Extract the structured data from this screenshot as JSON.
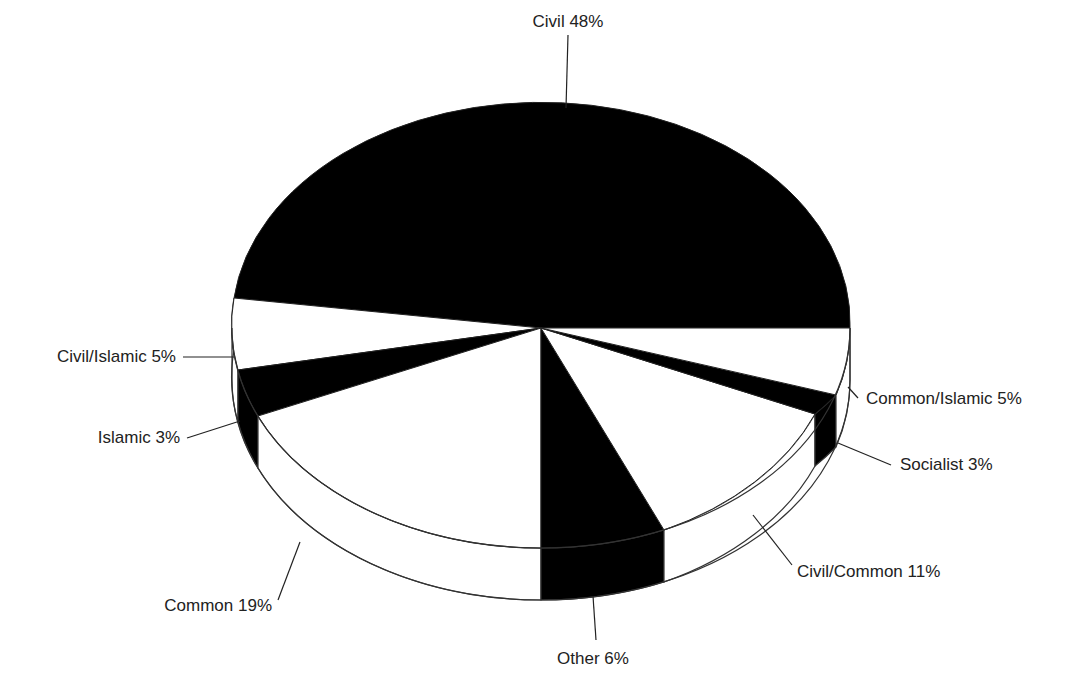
{
  "chart_data": {
    "type": "pie",
    "style": "3d-pie",
    "title": "",
    "categories": [
      "Civil",
      "Common/Islamic",
      "Socialist",
      "Civil/Common",
      "Other",
      "Common",
      "Islamic",
      "Civil/Islamic"
    ],
    "values": [
      48,
      5,
      3,
      11,
      6,
      19,
      3,
      5
    ],
    "unit": "%",
    "labels": [
      "Civil 48%",
      "Common/Islamic 5%",
      "Socialist 3%",
      "Civil/Common 11%",
      "Other 6%",
      "Common 19%",
      "Islamic 3%",
      "Civil/Islamic 5%"
    ],
    "colors": [
      "#000000",
      "#ffffff",
      "#000000",
      "#ffffff",
      "#000000",
      "#ffffff",
      "#000000",
      "#ffffff"
    ],
    "legend": "none (callout labels with leader lines)"
  },
  "geometry": {
    "cx": 541,
    "cy": 328,
    "rx": 309,
    "ry": 220,
    "depth": 52,
    "rim": {
      "right": [
        850,
        328
      ],
      "civil_left": [
        234,
        298
      ],
      "civislamic_end": [
        238,
        370
      ],
      "islamic_end": [
        258,
        416
      ],
      "common_end": [
        541,
        548
      ],
      "other_end": [
        664,
        530
      ],
      "civcommon_end": [
        815,
        414
      ],
      "socialist_end": [
        836,
        395
      ]
    }
  },
  "callouts": [
    {
      "key": "civil",
      "text": "Civil 48%",
      "x": 568,
      "y": 27,
      "anchor": "middle",
      "line": [
        [
          568,
          35
        ],
        [
          566,
          108
        ]
      ]
    },
    {
      "key": "civ_islamic",
      "text": "Civil/Islamic 5%",
      "x": 176,
      "y": 362,
      "anchor": "end",
      "line": [
        [
          183,
          357
        ],
        [
          234,
          357
        ]
      ]
    },
    {
      "key": "islamic",
      "text": "Islamic 3%",
      "x": 180,
      "y": 443,
      "anchor": "end",
      "line": [
        [
          187,
          438
        ],
        [
          240,
          421
        ]
      ]
    },
    {
      "key": "common",
      "text": "Common 19%",
      "x": 272,
      "y": 611,
      "anchor": "end",
      "line": [
        [
          278,
          600
        ],
        [
          300,
          542
        ]
      ]
    },
    {
      "key": "other",
      "text": "Other 6%",
      "x": 593,
      "y": 664,
      "anchor": "middle",
      "line": [
        [
          596,
          640
        ],
        [
          593,
          596
        ]
      ]
    },
    {
      "key": "civ_common",
      "text": "Civil/Common 11%",
      "x": 797,
      "y": 577,
      "anchor": "start",
      "line": [
        [
          792,
          565
        ],
        [
          753,
          515
        ]
      ]
    },
    {
      "key": "socialist",
      "text": "Socialist 3%",
      "x": 900,
      "y": 470,
      "anchor": "start",
      "line": [
        [
          891,
          465
        ],
        [
          838,
          443
        ]
      ]
    },
    {
      "key": "com_islamic",
      "text": "Common/Islamic 5%",
      "x": 866,
      "y": 404,
      "anchor": "start",
      "line": [
        [
          858,
          398
        ],
        [
          848,
          387
        ]
      ]
    }
  ]
}
